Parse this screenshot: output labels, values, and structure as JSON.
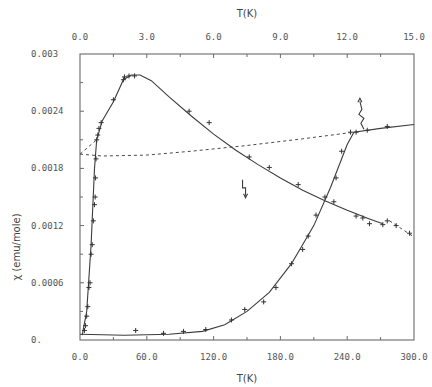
{
  "chart_data": {
    "type": "scatter",
    "title": "",
    "xlabel": "T(K)",
    "x2label": "T(K)",
    "ylabel": "χ (emu/mole)",
    "xlim": [
      0,
      300
    ],
    "x2lim": [
      0,
      15
    ],
    "ylim": [
      0,
      0.003
    ],
    "grid": false,
    "legend": null,
    "x_ticks": [
      "0.0",
      "60.0",
      "120.0",
      "180.0",
      "240.0",
      "300.0"
    ],
    "x2_ticks": [
      "0.0",
      "3.0",
      "6.0",
      "9.0",
      "12.0",
      "15.0"
    ],
    "y_ticks": [
      "0.",
      "0.0006",
      "0.0012",
      "0.0018",
      "0.0024",
      "0.003"
    ],
    "series": [
      {
        "name": "low-T data (top axis, 0-15 K)",
        "axis": "top",
        "style": "solid-fit-with-markers",
        "points": [
          {
            "x": 0.2,
            "y": 0.0001
          },
          {
            "x": 0.25,
            "y": 0.00015
          },
          {
            "x": 0.3,
            "y": 0.00025
          },
          {
            "x": 0.35,
            "y": 0.00035
          },
          {
            "x": 0.4,
            "y": 0.00055
          },
          {
            "x": 0.45,
            "y": 0.0006
          },
          {
            "x": 0.5,
            "y": 0.0009
          },
          {
            "x": 0.55,
            "y": 0.001
          },
          {
            "x": 0.6,
            "y": 0.00125
          },
          {
            "x": 0.65,
            "y": 0.00142
          },
          {
            "x": 0.68,
            "y": 0.0015
          },
          {
            "x": 0.7,
            "y": 0.0017
          },
          {
            "x": 0.72,
            "y": 0.0019
          },
          {
            "x": 0.75,
            "y": 0.0021
          },
          {
            "x": 0.8,
            "y": 0.00215
          },
          {
            "x": 0.85,
            "y": 0.00222
          },
          {
            "x": 0.95,
            "y": 0.00228
          },
          {
            "x": 1.5,
            "y": 0.00252
          },
          {
            "x": 1.95,
            "y": 0.00273
          },
          {
            "x": 2.0,
            "y": 0.00276
          },
          {
            "x": 2.2,
            "y": 0.00277
          },
          {
            "x": 2.45,
            "y": 0.00277
          },
          {
            "x": 4.9,
            "y": 0.0024
          },
          {
            "x": 5.8,
            "y": 0.00228
          },
          {
            "x": 7.6,
            "y": 0.00192
          },
          {
            "x": 8.5,
            "y": 0.00181
          },
          {
            "x": 9.8,
            "y": 0.00163
          },
          {
            "x": 11.4,
            "y": 0.00145
          },
          {
            "x": 12.4,
            "y": 0.0013
          },
          {
            "x": 12.7,
            "y": 0.00128
          },
          {
            "x": 13.0,
            "y": 0.00122
          },
          {
            "x": 13.6,
            "y": 0.00121
          }
        ],
        "fit": [
          {
            "x": 0.1,
            "y": 5e-05
          },
          {
            "x": 0.3,
            "y": 0.0003
          },
          {
            "x": 0.5,
            "y": 0.001
          },
          {
            "x": 0.65,
            "y": 0.0018
          },
          {
            "x": 0.75,
            "y": 0.0021
          },
          {
            "x": 1.0,
            "y": 0.0023
          },
          {
            "x": 1.5,
            "y": 0.0025
          },
          {
            "x": 1.95,
            "y": 0.00273
          },
          {
            "x": 2.3,
            "y": 0.00278
          },
          {
            "x": 2.7,
            "y": 0.00278
          },
          {
            "x": 3.2,
            "y": 0.00272
          },
          {
            "x": 4.0,
            "y": 0.00255
          },
          {
            "x": 5.0,
            "y": 0.00235
          },
          {
            "x": 6.0,
            "y": 0.00216
          },
          {
            "x": 7.0,
            "y": 0.00199
          },
          {
            "x": 8.0,
            "y": 0.00184
          },
          {
            "x": 9.0,
            "y": 0.0017
          },
          {
            "x": 10.0,
            "y": 0.00157
          },
          {
            "x": 11.0,
            "y": 0.00146
          },
          {
            "x": 12.0,
            "y": 0.00136
          },
          {
            "x": 13.0,
            "y": 0.00127
          },
          {
            "x": 13.6,
            "y": 0.00122
          }
        ]
      },
      {
        "name": "high-T data (bottom axis, 0-300 K)",
        "axis": "bottom",
        "style": "solid-fit-with-markers",
        "points": [
          {
            "x": 50,
            "y": 0.0001
          },
          {
            "x": 75,
            "y": 7e-05
          },
          {
            "x": 93,
            "y": 9e-05
          },
          {
            "x": 113,
            "y": 0.00011
          },
          {
            "x": 136,
            "y": 0.00021
          },
          {
            "x": 148,
            "y": 0.00032
          },
          {
            "x": 165,
            "y": 0.0004
          },
          {
            "x": 176,
            "y": 0.00055
          },
          {
            "x": 190,
            "y": 0.0008
          },
          {
            "x": 200,
            "y": 0.00095
          },
          {
            "x": 205,
            "y": 0.00109
          },
          {
            "x": 212,
            "y": 0.00131
          },
          {
            "x": 220,
            "y": 0.0015
          },
          {
            "x": 230,
            "y": 0.0017
          },
          {
            "x": 235,
            "y": 0.00198
          },
          {
            "x": 243,
            "y": 0.00218
          },
          {
            "x": 248,
            "y": 0.00218
          },
          {
            "x": 258,
            "y": 0.0022
          },
          {
            "x": 276,
            "y": 0.00224
          }
        ],
        "fit": [
          {
            "x": 0,
            "y": 6e-05
          },
          {
            "x": 40,
            "y": 5e-05
          },
          {
            "x": 80,
            "y": 6e-05
          },
          {
            "x": 110,
            "y": 9e-05
          },
          {
            "x": 130,
            "y": 0.00016
          },
          {
            "x": 150,
            "y": 0.0003
          },
          {
            "x": 170,
            "y": 0.0005
          },
          {
            "x": 190,
            "y": 0.0008
          },
          {
            "x": 210,
            "y": 0.0012
          },
          {
            "x": 225,
            "y": 0.0016
          },
          {
            "x": 240,
            "y": 0.00205
          },
          {
            "x": 246,
            "y": 0.00218
          },
          {
            "x": 270,
            "y": 0.00222
          },
          {
            "x": 300,
            "y": 0.00226
          }
        ]
      },
      {
        "name": "dashed extrapolation (bottom axis)",
        "axis": "bottom",
        "style": "dashed",
        "fit": [
          {
            "x": 0,
            "y": 0.00195
          },
          {
            "x": 20,
            "y": 0.00193
          },
          {
            "x": 60,
            "y": 0.00194
          },
          {
            "x": 100,
            "y": 0.00198
          },
          {
            "x": 150,
            "y": 0.00204
          },
          {
            "x": 200,
            "y": 0.00211
          },
          {
            "x": 246,
            "y": 0.00218
          }
        ]
      },
      {
        "name": "dashed extrapolation of low-T fit (top axis)",
        "axis": "top",
        "style": "dashed",
        "points": [
          {
            "x": 13.8,
            "y": 0.00125
          },
          {
            "x": 14.2,
            "y": 0.0012
          },
          {
            "x": 14.8,
            "y": 0.00112
          }
        ],
        "fit": [
          {
            "x": 13.9,
            "y": 0.00125
          },
          {
            "x": 15.0,
            "y": 0.00108
          }
        ]
      },
      {
        "name": "dashed low-T connector",
        "axis": "top",
        "style": "dashed",
        "fit": [
          {
            "x": 0.0,
            "y": 0.00195
          },
          {
            "x": 0.75,
            "y": 0.0021
          }
        ]
      }
    ],
    "annotations": [
      {
        "type": "arrow",
        "description": "wavy arrow pointing to upper branch near T≈255 K",
        "x": 255,
        "y": 0.0022,
        "axis": "bottom"
      },
      {
        "type": "arrow",
        "description": "wavy arrow pointing to lower-T fit near T≈7.5 K",
        "x": 7.5,
        "y": 0.00165,
        "axis": "top"
      }
    ]
  }
}
